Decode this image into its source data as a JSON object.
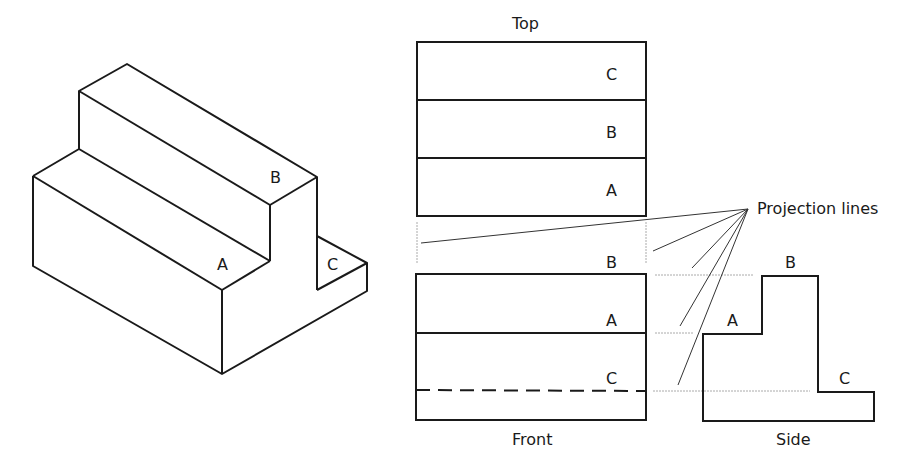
{
  "figure": {
    "isometric": {
      "labels": {
        "a": "A",
        "b": "B",
        "c": "C"
      }
    },
    "top_view": {
      "title": "Top",
      "labels": {
        "c": "C",
        "b": "B",
        "a": "A"
      }
    },
    "front_view": {
      "title": "Front",
      "labels": {
        "b": "B",
        "a": "A",
        "c": "C"
      }
    },
    "side_view": {
      "title": "Side",
      "labels": {
        "b": "B",
        "a": "A",
        "c": "C"
      }
    },
    "annotation": {
      "projection_label": "Projection lines"
    },
    "colors": {
      "outline": "#1a1a1a",
      "projection_line": "#333333",
      "guide_line": "#aaaaaa"
    }
  }
}
